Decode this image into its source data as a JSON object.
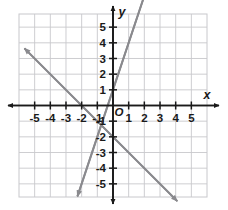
{
  "figure": {
    "kind": "coordinate-plane",
    "background_color": "#ffffff",
    "grid_color": "#c8c8cc",
    "axis_color": "#1a1a1a",
    "line_color": "#8a8a8e",
    "label_color": "#1a1a1a"
  },
  "axes": {
    "x_axis_label": "x",
    "y_axis_label": "y",
    "origin_label": "O",
    "x_ticks": [
      "-5",
      "-4",
      "-3",
      "-2",
      "-1",
      "1",
      "2",
      "3",
      "4",
      "5"
    ],
    "y_ticks": [
      "5",
      "4",
      "3",
      "2",
      "1",
      "-1",
      "-2",
      "-3",
      "-4",
      "-5"
    ],
    "xlim": [
      -5.98,
      5.98
    ],
    "ylim": [
      -5.82,
      5.82
    ],
    "grid": true,
    "grid_step": 1
  },
  "chart_data": {
    "type": "line",
    "title": "",
    "xlabel": "x",
    "ylabel": "y",
    "xlim": [
      -5.98,
      5.98
    ],
    "ylim": [
      -5.82,
      5.82
    ],
    "grid": true,
    "legend": "none",
    "series": [
      {
        "name": "rising-line",
        "slope": 3,
        "intercept": 1,
        "x": [
          -2.27,
          2.5
        ],
        "y": [
          -5.8,
          8.5
        ],
        "points": [
          [
            -2.27,
            -5.8
          ],
          [
            0,
            1
          ],
          [
            1,
            4
          ],
          [
            1.6,
            5.8
          ]
        ],
        "arrows": "both",
        "color": "#8a8a8e"
      },
      {
        "name": "falling-line",
        "slope": -1,
        "intercept": -2,
        "x": [
          -5.65,
          4.1
        ],
        "y": [
          3.65,
          -6.1
        ],
        "points": [
          [
            -5.65,
            3.65
          ],
          [
            -2,
            0
          ],
          [
            0,
            -2
          ],
          [
            4.1,
            -6.1
          ]
        ],
        "arrows": "both",
        "color": "#8a8a8e"
      }
    ],
    "intersection": [
      -0.75,
      -1.25
    ]
  },
  "tick_positions": {
    "x": [
      -5,
      -4,
      -3,
      -2,
      -1,
      1,
      2,
      3,
      4,
      5
    ],
    "y": [
      5,
      4,
      3,
      2,
      1,
      -1,
      -2,
      -3,
      -4,
      -5
    ]
  }
}
